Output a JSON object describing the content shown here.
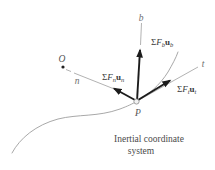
{
  "figure": {
    "axis_labels": {
      "b": "b",
      "n": "n",
      "t": "t"
    },
    "point_labels": {
      "origin": "O",
      "particle": "P"
    },
    "force_labels": {
      "fb": {
        "sigma": "Σ",
        "f": "F",
        "f_sub": "b",
        "u": "u",
        "u_sub": "b"
      },
      "fn": {
        "sigma": "Σ",
        "f": "F",
        "f_sub": "n",
        "u": "u",
        "u_sub": "n"
      },
      "ft": {
        "sigma": "Σ",
        "f": "F",
        "f_sub": "t",
        "u": "u",
        "u_sub": "t"
      }
    },
    "caption": {
      "line1": "Inertial coordinate",
      "line2": "system"
    },
    "colors": {
      "curve": "#9e9e9e",
      "axis_line": "#9e9e9e",
      "vector": "#1c1c1c",
      "axis_label": "#6e6e6e",
      "force_label": "#3a3a3a",
      "caption_text": "#4a4a4a"
    }
  }
}
